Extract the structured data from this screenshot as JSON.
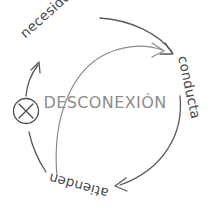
{
  "diagram": {
    "type": "cycle",
    "center_label": "DESCONEXIÓN",
    "labels": [
      {
        "text": "necesidad",
        "position": "top-left"
      },
      {
        "text": "conducta",
        "position": "right"
      },
      {
        "text": "atienden",
        "position": "bottom"
      }
    ],
    "marker": {
      "name": "x-in-circle",
      "glyph": "✕",
      "position": "left-arc",
      "meaning": "break-in-cycle"
    },
    "colors": {
      "background": "#ffffff",
      "stroke": "#5a5a5a",
      "label_text": "#4a4a4a",
      "center_text": "#8d8d8d"
    },
    "arrows": [
      {
        "name": "outer-arc-top",
        "from": "necesidad",
        "to": "conducta"
      },
      {
        "name": "inner-arc",
        "from": "bottom-left",
        "to": "right"
      },
      {
        "name": "outer-arc-bottom",
        "from": "conducta",
        "to": "atienden"
      },
      {
        "name": "outer-arc-left",
        "from": "atienden",
        "to": "necesidad"
      }
    ]
  }
}
